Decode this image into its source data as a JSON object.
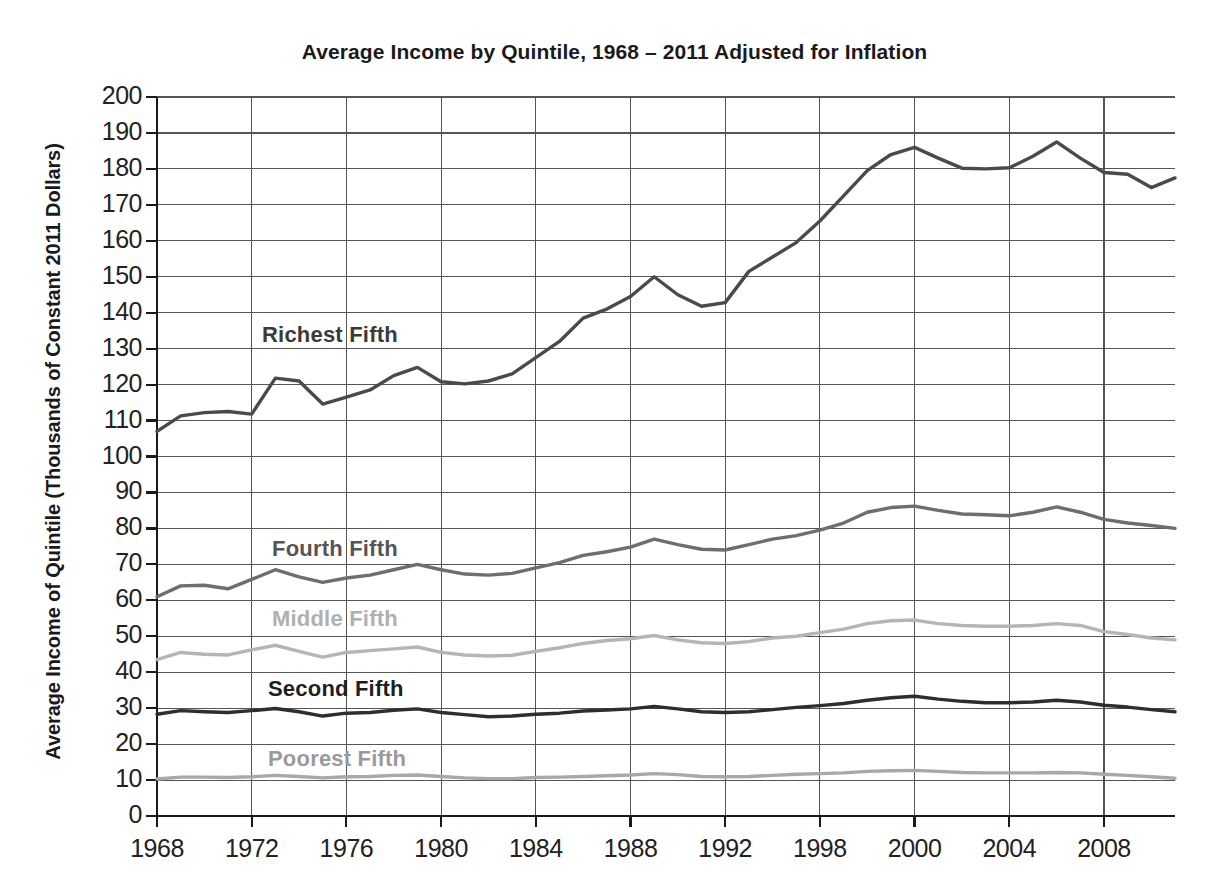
{
  "chart_data": {
    "type": "line",
    "title": "Average Income by Quintile, 1968 – 2011 Adjusted for Inflation",
    "xlabel": "",
    "ylabel": "Average Income of Quintile (Thousands of Constant 2011 Dollars)",
    "xlim": [
      1968,
      2011
    ],
    "ylim": [
      0,
      200
    ],
    "ytick_step": 10,
    "grid": true,
    "legend_position": "inline-annotations",
    "yticks": [
      "200",
      "190",
      "180",
      "170",
      "160",
      "150",
      "140",
      "130",
      "120",
      "110",
      "100",
      "90",
      "80",
      "70",
      "60",
      "50",
      "40",
      "30",
      "20",
      "10",
      "0"
    ],
    "xticks": [
      "1968",
      "1972",
      "1976",
      "1980",
      "1984",
      "1988",
      "1992",
      "1998",
      "2000",
      "2004",
      "2008"
    ],
    "xtick_years": [
      1968,
      1972,
      1976,
      1980,
      1984,
      1988,
      1992,
      1996,
      2000,
      2004,
      2008
    ],
    "x": [
      1968,
      1969,
      1970,
      1971,
      1972,
      1973,
      1974,
      1975,
      1976,
      1977,
      1978,
      1979,
      1980,
      1981,
      1982,
      1983,
      1984,
      1985,
      1986,
      1987,
      1988,
      1989,
      1990,
      1991,
      1992,
      1993,
      1994,
      1995,
      1996,
      1997,
      1998,
      1999,
      2000,
      2001,
      2002,
      2003,
      2004,
      2005,
      2006,
      2007,
      2008,
      2009,
      2010,
      2011
    ],
    "series": [
      {
        "name": "Richest Fifth",
        "color": "#4a4a4a",
        "label_color": "#3a3a3a",
        "label_x": 262,
        "label_y": 322,
        "values": [
          107.0,
          111.3,
          112.2,
          112.5,
          111.8,
          121.8,
          121.0,
          114.6,
          116.5,
          118.5,
          122.5,
          124.8,
          120.8,
          120.2,
          121.0,
          123.0,
          127.5,
          132.0,
          138.5,
          141.0,
          144.5,
          150.0,
          145.0,
          141.8,
          142.8,
          151.5,
          155.5,
          159.5,
          165.5,
          172.5,
          179.5,
          184.0,
          186.0,
          183.0,
          180.2,
          180.0,
          180.3,
          183.5,
          187.5,
          183.0,
          179.0,
          178.5,
          174.8,
          177.5
        ]
      },
      {
        "name": "Fourth Fifth",
        "color": "#6e6e6e",
        "label_color": "#555555",
        "label_x": 272,
        "label_y": 536,
        "values": [
          61.0,
          64.0,
          64.2,
          63.2,
          65.8,
          68.5,
          66.5,
          65.0,
          66.2,
          67.0,
          68.5,
          70.0,
          68.5,
          67.3,
          67.0,
          67.5,
          69.0,
          70.5,
          72.5,
          73.5,
          74.8,
          77.0,
          75.5,
          74.2,
          74.0,
          75.5,
          77.0,
          78.0,
          79.5,
          81.5,
          84.5,
          85.8,
          86.2,
          85.0,
          84.0,
          83.8,
          83.5,
          84.5,
          86.0,
          84.5,
          82.5,
          81.5,
          80.8,
          80.0
        ]
      },
      {
        "name": "Middle Fifth",
        "color": "#b5b5b5",
        "label_color": "#b0b0b0",
        "label_x": 272,
        "label_y": 606,
        "values": [
          43.5,
          45.5,
          45.0,
          44.8,
          46.2,
          47.5,
          45.8,
          44.2,
          45.5,
          46.0,
          46.5,
          47.0,
          45.5,
          44.8,
          44.5,
          44.7,
          45.8,
          46.8,
          48.0,
          48.8,
          49.3,
          50.2,
          49.0,
          48.2,
          48.0,
          48.5,
          49.5,
          50.0,
          51.0,
          52.0,
          53.5,
          54.3,
          54.5,
          53.5,
          53.0,
          52.8,
          52.8,
          53.0,
          53.5,
          53.0,
          51.3,
          50.5,
          49.5,
          49.0
        ]
      },
      {
        "name": "Second Fifth",
        "color": "#2e2e2e",
        "label_color": "#1f1f1f",
        "label_x": 268,
        "label_y": 676,
        "values": [
          28.3,
          29.3,
          29.0,
          28.8,
          29.3,
          29.9,
          29.0,
          27.8,
          28.6,
          28.8,
          29.4,
          29.8,
          28.8,
          28.2,
          27.6,
          27.8,
          28.3,
          28.6,
          29.2,
          29.5,
          29.8,
          30.5,
          29.8,
          29.0,
          28.8,
          29.0,
          29.6,
          30.2,
          30.7,
          31.3,
          32.2,
          32.9,
          33.3,
          32.5,
          31.9,
          31.5,
          31.5,
          31.7,
          32.2,
          31.7,
          30.8,
          30.3,
          29.6,
          29.0
        ]
      },
      {
        "name": "Poorest Fifth",
        "color": "#a8a8a8",
        "label_color": "#9a9a9a",
        "label_x": 268,
        "label_y": 746,
        "values": [
          10.3,
          10.8,
          10.8,
          10.7,
          10.9,
          11.3,
          11.0,
          10.6,
          10.9,
          11.0,
          11.3,
          11.4,
          11.0,
          10.6,
          10.4,
          10.4,
          10.7,
          10.8,
          11.0,
          11.2,
          11.4,
          11.8,
          11.5,
          11.0,
          10.9,
          11.0,
          11.3,
          11.6,
          11.8,
          12.0,
          12.4,
          12.6,
          12.7,
          12.4,
          12.1,
          12.0,
          12.0,
          12.0,
          12.1,
          12.0,
          11.6,
          11.3,
          10.9,
          10.5
        ]
      }
    ]
  },
  "plot": {
    "left": 157,
    "right": 1175,
    "top": 97,
    "bottom": 816,
    "grid_color": "#555555",
    "axis_color": "#1a1a1a"
  }
}
